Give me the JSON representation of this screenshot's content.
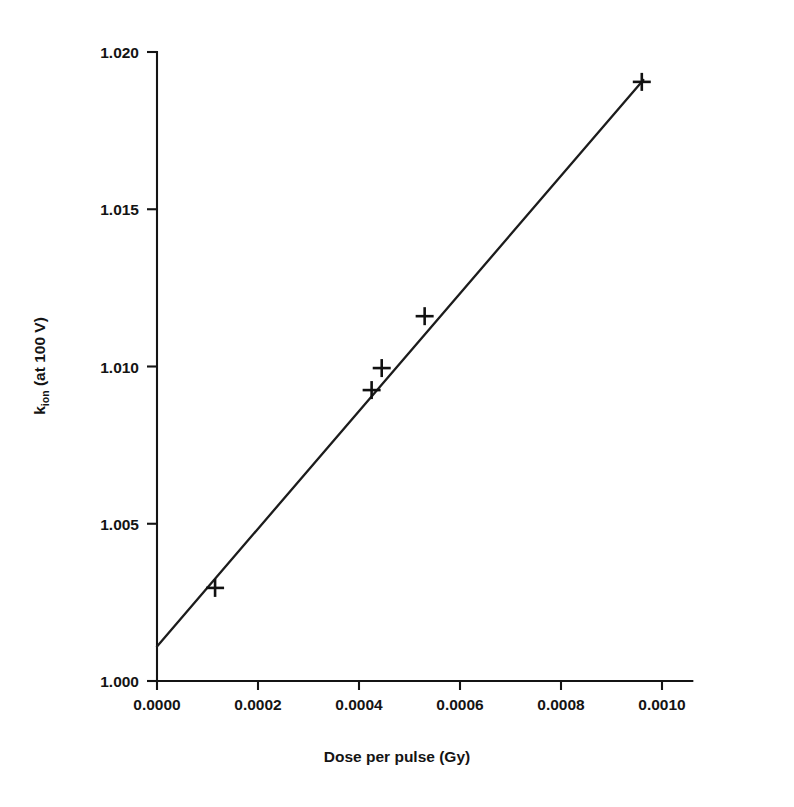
{
  "chart_data": {
    "type": "scatter",
    "title": "",
    "xlabel": "Dose per pulse (Gy)",
    "ylabel": "k_ion (at 100 V)",
    "ylabel_base": "k",
    "ylabel_sub": "ion",
    "ylabel_rest": " (at 100 V)",
    "xlim": [
      0.0,
      0.00106
    ],
    "ylim": [
      1.0,
      1.02
    ],
    "xticks": [
      0.0,
      0.0002,
      0.0004,
      0.0006,
      0.0008,
      0.001
    ],
    "xticklabels": [
      "0.0000",
      "0.0002",
      "0.0004",
      "0.0006",
      "0.0008",
      "0.0010"
    ],
    "yticks": [
      1.0,
      1.005,
      1.01,
      1.015,
      1.02
    ],
    "yticklabels": [
      "1.000",
      "1.005",
      "1.010",
      "1.015",
      "1.020"
    ],
    "grid": false,
    "legend": null,
    "marker_style": "plus",
    "x": [
      0.000115,
      0.000425,
      0.000445,
      0.00053,
      0.00096
    ],
    "y": [
      1.00296,
      1.00925,
      1.00995,
      1.0116,
      1.01905
    ],
    "points": [
      {
        "x": 0.000115,
        "y": 1.00296
      },
      {
        "x": 0.000425,
        "y": 1.00925
      },
      {
        "x": 0.000445,
        "y": 1.00995
      },
      {
        "x": 0.00053,
        "y": 1.0116
      },
      {
        "x": 0.00096,
        "y": 1.01905
      }
    ],
    "fit": {
      "type": "line",
      "intercept": 1.0011,
      "slope": 18.7,
      "x_start": 0.0,
      "x_end": 0.000963,
      "y_start": 1.0011,
      "y_end": 1.01911
    },
    "axis_color": "#141414",
    "line_color": "#1c1c1c",
    "marker_color": "#111111",
    "background": "#ffffff"
  },
  "layout": {
    "plot_left_px": 157,
    "plot_bottom_px": 681,
    "plot_top_px": 52,
    "px_per_xunit": 505000,
    "px_per_yunit": 31450
  }
}
